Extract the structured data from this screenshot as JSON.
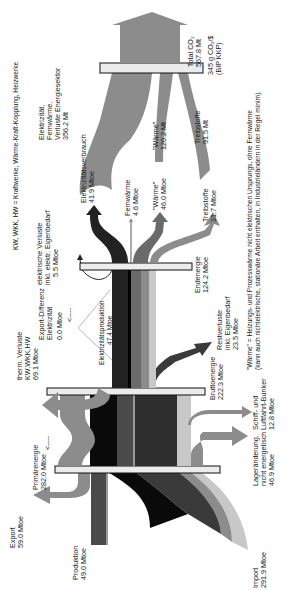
{
  "diagram": {
    "type": "sankey",
    "orientation": "rotated-90-ccw",
    "legend_kw": "KW, WKK, HW  = Kraftwerke, Wärme-Kraft-Kopplung, Heizwerke",
    "footnote_line1": "\"Wärme\" = Heizungs- und Prozesswärme nicht elektrischen Ursprungs, ohne Fernwärme",
    "footnote_line2": "(kann auch nichtelektrische, stationäre Arbeit enthalten, in Industrieländern in der Regel minim).",
    "colors": {
      "black": "#0a0a0a",
      "dark": "#2e2e2e",
      "darkgray": "#4a4a4a",
      "midgray": "#707070",
      "gray": "#8c8c8c",
      "lightgray": "#c8c8c8",
      "bar_fill": "#ececec",
      "bar_stroke": "#111111"
    }
  },
  "sources": {
    "produktion": {
      "label": "Produktion",
      "value": "49.0 Mtoe"
    },
    "import": {
      "label": "Import",
      "value": "291.9 Mtoe"
    },
    "export": {
      "label": "Export",
      "value": "59.0 Mtoe"
    }
  },
  "nodes": {
    "primaerenergie": {
      "label": "Primärenergie",
      "value": "282.0 Mtoe"
    },
    "bruttoenergie": {
      "label": "Bruttoenergie",
      "value": "222.3 Mtoe"
    },
    "endenergie": {
      "label": "Endenergie",
      "value": "124.2 Mtoe"
    }
  },
  "losses": {
    "lageraenderung": {
      "line1": "Lageränderung,",
      "line2": "nicht energetisch",
      "value": "46.9 Mtoe"
    },
    "schiff": {
      "line1": "Schiff- und",
      "line2": "Luftfahrt-Bunker",
      "value": "12.8 Mtoe"
    },
    "therm": {
      "line1": "therm. Verluste",
      "line2": "KW,WKK,HW",
      "value": "69.1 Mtoe"
    },
    "restverluste": {
      "line1": "Restverluste",
      "line2": "inkl. Eigenbedarf",
      "value": "23.5 Mtoe"
    },
    "export_diff": {
      "line1": "Export-Differenz",
      "line2": "Elektrizität",
      "value": "0.0 Mtoe"
    },
    "elektr_verluste": {
      "line1": "elektrische Verluste",
      "line2": "inkl. elektr. Eigenbedarf",
      "value": "5.5 Mtoe"
    },
    "elektrizitaetsproduktion": {
      "line1": "Elektrizitätsproduktion",
      "value": "47.4 Mtoe"
    }
  },
  "final_uses": {
    "elektrizitaetsverbrauch": {
      "label": "Elektrizitätsverbrauch",
      "value": "41.9 Mtoe"
    },
    "fernwaerme": {
      "label": "Fernwärme",
      "value": "4.6 Mtoe"
    },
    "waerme": {
      "label": "\"Wärme\"",
      "value": "46.0 Mtoe"
    },
    "treibstoffe": {
      "label": "Treibstoffe",
      "value": "31.7 Mtoe"
    }
  },
  "co2": {
    "total_label": "Total CO₂",
    "total_value": "567.8 Mt",
    "intensity_value": "345 g CO₂/$",
    "intensity_basis": "(BIP KKP)",
    "elektrizitaet": {
      "line1": "Elektrizität,",
      "line2": "Fernwärme,",
      "line3": "Verluste Energiesektor",
      "value": "356.2 Mt"
    },
    "waerme": {
      "label": "\"Wärme\"",
      "value": "120.2 Mt"
    },
    "treibstoffe": {
      "label": "Treibstoffe",
      "value": "91.5 Mt"
    }
  },
  "arrows": {
    "back_arrow": "<----"
  }
}
